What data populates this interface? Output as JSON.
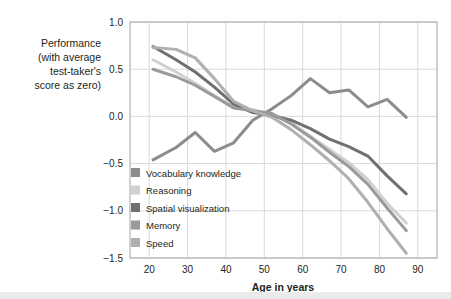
{
  "chart_data": {
    "type": "line",
    "title": "",
    "subtitle": "",
    "xlabel": "Age in years",
    "ylabel": "Performance (with average test-taker's score as zero)",
    "ylabel_lines": [
      "Performance",
      "(with average",
      "test-taker's",
      "score as zero)"
    ],
    "xlim": [
      15,
      95
    ],
    "ylim": [
      -1.5,
      1.0
    ],
    "xticks": [
      20,
      30,
      40,
      50,
      60,
      70,
      80,
      90
    ],
    "xtick_labels": [
      "20",
      "30",
      "40",
      "50",
      "60",
      "70",
      "80",
      "90"
    ],
    "yticks": [
      1.0,
      0.5,
      0.0,
      -0.5,
      -1.0,
      -1.5
    ],
    "ytick_labels": [
      "1.0",
      "0.5",
      "0.0",
      "-0.5",
      "-1.0",
      "-1.5"
    ],
    "grid": true,
    "legend_position": "inside-lower-left",
    "x": [
      21,
      27,
      32,
      37,
      42,
      47,
      52,
      57,
      62,
      67,
      72,
      77,
      82,
      87
    ],
    "series": [
      {
        "name": "Vocabulary knowledge",
        "color": "#8c8c8c",
        "values": [
          -0.46,
          -0.33,
          -0.17,
          -0.37,
          -0.28,
          -0.04,
          0.08,
          0.22,
          0.4,
          0.25,
          0.28,
          0.1,
          0.18,
          -0.01
        ]
      },
      {
        "name": "Reasoning",
        "color": "#d0d0d0",
        "values": [
          0.6,
          0.47,
          0.35,
          0.22,
          0.1,
          0.07,
          0.02,
          -0.07,
          -0.21,
          -0.35,
          -0.49,
          -0.67,
          -0.92,
          -1.13
        ]
      },
      {
        "name": "Spatial visualization",
        "color": "#707070",
        "values": [
          0.74,
          0.6,
          0.47,
          0.31,
          0.13,
          0.04,
          0.01,
          -0.04,
          -0.13,
          -0.24,
          -0.32,
          -0.42,
          -0.63,
          -0.82
        ]
      },
      {
        "name": "Memory",
        "color": "#9a9a9a",
        "values": [
          0.5,
          0.42,
          0.33,
          0.21,
          0.09,
          0.06,
          0.03,
          -0.08,
          -0.22,
          -0.38,
          -0.53,
          -0.72,
          -0.97,
          -1.21
        ]
      },
      {
        "name": "Speed",
        "color": "#b0b0b0",
        "values": [
          0.73,
          0.71,
          0.62,
          0.4,
          0.16,
          0.06,
          -0.01,
          -0.14,
          -0.3,
          -0.47,
          -0.66,
          -0.91,
          -1.19,
          -1.45
        ]
      }
    ]
  }
}
